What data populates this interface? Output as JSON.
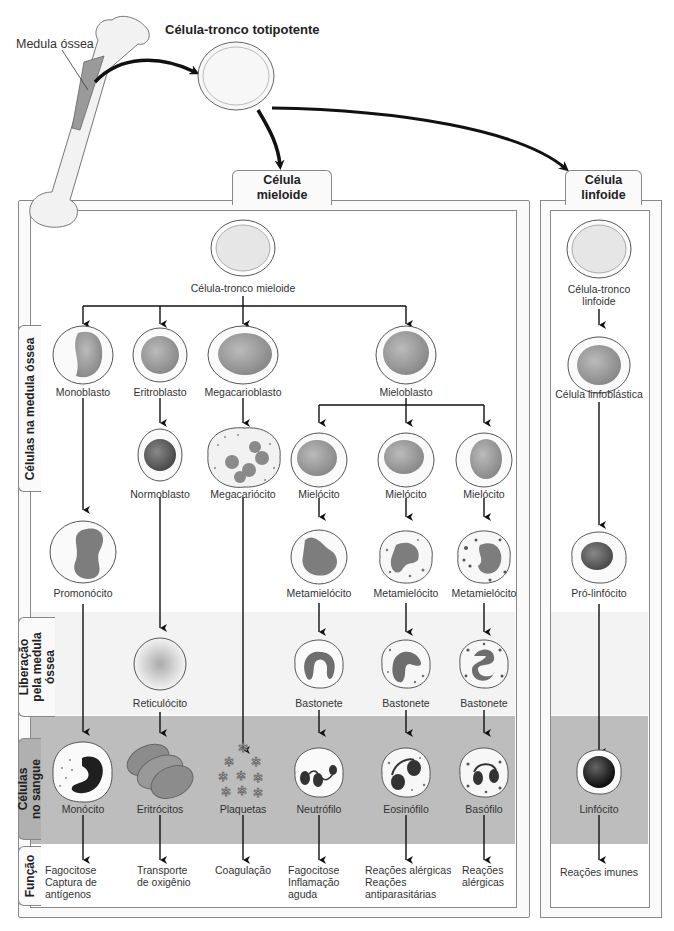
{
  "header": {
    "bone_label": "Medula óssea",
    "stem_cell_title": "Célula-tronco totipotente"
  },
  "myeloid": {
    "tab_line1": "Célula",
    "tab_line2": "mieloide",
    "stem": "Célula-tronco mieloide",
    "row1": [
      "Monoblasto",
      "Eritroblasto",
      "Megacarioblasto",
      "Mieloblasto"
    ],
    "row2": [
      "Normoblasto",
      "Megacariócito",
      "Mielócito",
      "Mielócito",
      "Mielócito"
    ],
    "row3": [
      "Promonócito",
      "Metamielócito",
      "Metamielócito",
      "Metamielócito"
    ],
    "release": [
      "Reticulócito",
      "Bastonete",
      "Bastonete",
      "Bastonete"
    ],
    "blood": [
      "Monócito",
      "Eritrócitos",
      "Plaquetas",
      "Neutrófilo",
      "Eosinófilo",
      "Basófilo"
    ],
    "functions": [
      [
        "Fagocitose",
        "Captura de",
        "antígenos"
      ],
      [
        "Transporte",
        "de oxigênio"
      ],
      [
        "Coagulação"
      ],
      [
        "Fagocitose",
        "Inflamação",
        "aguda"
      ],
      [
        "Reações alérgicas",
        "Reações",
        "antiparasitárias"
      ],
      [
        "Reações",
        "alérgicas"
      ]
    ]
  },
  "lymphoid": {
    "tab_line1": "Célula",
    "tab_line2": "linfoide",
    "stem_line1": "Célula-tronco",
    "stem_line2": "linfoide",
    "blast": "Célula linfoblástica",
    "pro": "Pró-linfócito",
    "blood": "Linfócito",
    "function": "Reações imunes"
  },
  "rows": {
    "marrow": "Células na medula óssea",
    "release_l1": "Liberação",
    "release_l2": "pela medula",
    "release_l3": "óssea",
    "blood_l1": "Células",
    "blood_l2": "no sangue",
    "function": "Função"
  },
  "colors": {
    "blood_band": "#bdbdbd",
    "release_band": "#f3f3f3",
    "nucleus": "#8a8a8a",
    "dark_nucleus": "#444444",
    "border": "#888888"
  }
}
